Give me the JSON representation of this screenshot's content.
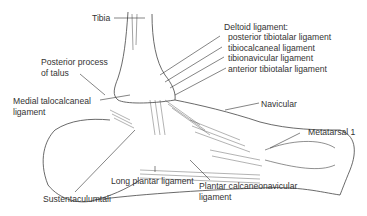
{
  "diagram": {
    "labels": {
      "tibia": "Tibia",
      "posterior_process_1": "Posterior process",
      "posterior_process_2": "of talus",
      "medial_talocalcaneal_1": "Medial talocalcaneal",
      "medial_talocalcaneal_2": "ligament",
      "deltoid_title": "Deltoid ligament:",
      "deltoid_1": "posterior tibiotalar ligament",
      "deltoid_2": "tibiocalcaneal ligament",
      "deltoid_3": "tibionavicular ligament",
      "deltoid_4": "anterior tibiotalar ligament",
      "navicular": "Navicular",
      "metatarsal": "Metatarsal 1",
      "sustentaculum": "Sustentaculumtali",
      "long_plantar": "Long plantar ligament",
      "plantar_calc_1": "Plantar calcaneonavicular",
      "plantar_calc_2": "ligament"
    },
    "colors": {
      "line": "#333333",
      "text": "#333333",
      "background": "#ffffff"
    }
  }
}
